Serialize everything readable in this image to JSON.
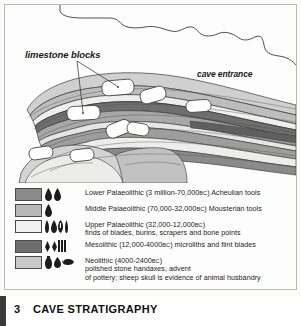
{
  "figure": {
    "title_number": "3",
    "title": "CAVE STRATIGRAPHY",
    "annotations": {
      "limestone_blocks": "limestone blocks",
      "cave_entrance": "cave entrance"
    }
  },
  "colors": {
    "lower_palaeolithic": "#8a8a8a",
    "middle_palaeolithic": "#b8b8b8",
    "upper_palaeolithic": "#f0f0ee",
    "mesolithic": "#6e6e6e",
    "neolithic": "#c9c9c9",
    "limestone_block": "#ffffff",
    "outline": "#3a3a3a",
    "title_rule": "#3b3b3b"
  },
  "legend": {
    "rows": [
      {
        "swatch": "#8a8a8a",
        "icons": [
          "handaxe-icon",
          "handaxe-icon"
        ],
        "line1": "Lower Palaeolithic (3 million-70,000",
        "bc1": "BC",
        "line1b": ") Acheulian tools",
        "line2": ""
      },
      {
        "swatch": "#b8b8b8",
        "icons": [
          "handaxe-icon"
        ],
        "line1": "Middle Palaeolithic (70,000-32,000",
        "bc1": "BC",
        "line1b": ") Mousterian tools",
        "line2": ""
      },
      {
        "swatch": "#f0f0ee",
        "icons": [
          "blade-icon",
          "point-icon",
          "burin-icon",
          "bone-point-icon"
        ],
        "line1": "Upper Palaeolithic (32,000-12,000",
        "bc1": "BC",
        "line1b": ")",
        "line2": "finds of blades, burins, scrapers and bone points"
      },
      {
        "swatch": "#6e6e6e",
        "icons": [
          "microlith-icon",
          "microlith-icon",
          "flint-blade-icon"
        ],
        "line1": "Mesolithic (12,000-4000",
        "bc1": "BC",
        "line1b": ") microliths and flint blades",
        "line2": ""
      },
      {
        "swatch": "#c9c9c9",
        "icons": [
          "pottery-icon",
          "polished-axe-icon",
          "sheep-skull-icon"
        ],
        "line1": "Neolithic (4000-2400",
        "bc1": "BC",
        "line1b": ")",
        "line2": "polished stone handaxes, advent",
        "line3": "of pottery; sheep skull is evidence of animal husbandry"
      }
    ]
  }
}
